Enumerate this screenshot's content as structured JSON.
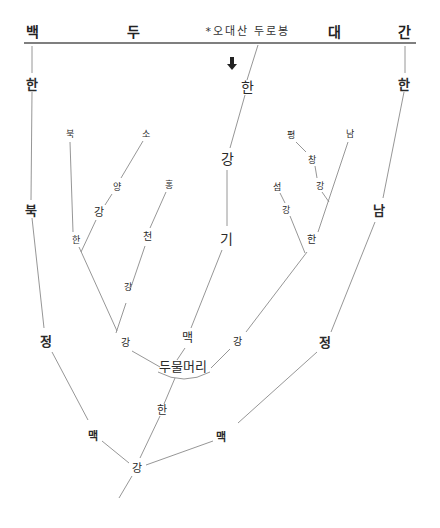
{
  "header": {
    "title_chars": [
      "백",
      "두",
      "대",
      "간"
    ],
    "peak_label": "*오대산 두로봉"
  },
  "arrow_icon": "down-arrow",
  "rivers": {
    "central_top": "한",
    "central_mid1": "강",
    "central_mid2": "기",
    "central_mid3": "맥",
    "left_col": [
      "한",
      "북",
      "정"
    ],
    "right_col": [
      "한",
      "남",
      "정"
    ],
    "bukhan_branch": [
      "북",
      "한"
    ],
    "soyang_branch": [
      "소",
      "양",
      "강"
    ],
    "hongcheon_branch": [
      "홍",
      "천",
      "강"
    ],
    "pyeongchang_branch": [
      "평",
      "창",
      "강"
    ],
    "seom_branch": [
      "섬",
      "강"
    ],
    "namhan_branch": [
      "남",
      "한"
    ],
    "left_gang": "강",
    "right_gang": "강",
    "confluence": "두물머리",
    "below_confluence": "한",
    "left_maek": "맥",
    "right_maek": "맥",
    "bottom_gang": "강"
  },
  "line_color": "#8a8a8a",
  "header_line_color": "#555555"
}
